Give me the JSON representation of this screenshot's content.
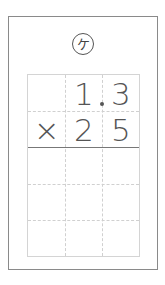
{
  "problem": {
    "label": "ケ",
    "multiplicand": {
      "digits": [
        "",
        "1",
        "3"
      ],
      "decimal_after_index": 1,
      "display": "1.3"
    },
    "multiplier": {
      "operator": "×",
      "digits": [
        "2",
        "5"
      ],
      "display": "25"
    }
  },
  "grid": {
    "columns": 3,
    "rows": 5,
    "line_color": "#d0d0d0",
    "rule_color": "#777777"
  },
  "colors": {
    "text": "#555555",
    "border": "#8a8a8a"
  }
}
